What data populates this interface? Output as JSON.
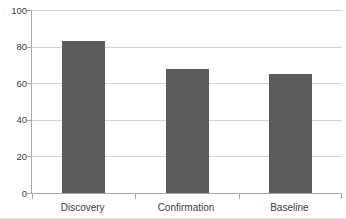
{
  "chart_data": {
    "type": "bar",
    "title": "",
    "xlabel": "",
    "ylabel": "",
    "categories": [
      "Discovery",
      "Confirmation",
      "Baseline"
    ],
    "values": [
      83,
      68,
      65
    ],
    "ylim": [
      0,
      100
    ],
    "yticks": [
      0,
      20,
      40,
      60,
      80,
      100
    ],
    "grid": true,
    "legend": false,
    "colors": {
      "bar_fill": "#5c5c5c",
      "gridline": "#d4d4d4",
      "axis": "#a9a9a9",
      "tick_label": "#404040",
      "background": "#ffffff"
    }
  }
}
